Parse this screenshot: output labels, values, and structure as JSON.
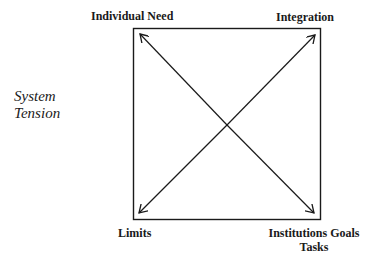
{
  "diagram": {
    "side_label": {
      "line1": "System",
      "line2": "Tension"
    },
    "corners": {
      "top_left": "Individual Need",
      "top_right": "Integration",
      "bottom_left": "Limits",
      "bottom_right_line1": "Institutions Goals",
      "bottom_right_line2": "Tasks"
    },
    "arrows": [
      {
        "from": "center",
        "to": "top_left"
      },
      {
        "from": "center",
        "to": "top_right"
      },
      {
        "from": "center",
        "to": "bottom_left"
      },
      {
        "from": "center",
        "to": "bottom_right"
      }
    ],
    "colors": {
      "stroke": "#1a1a1a",
      "background": "#ffffff"
    }
  }
}
